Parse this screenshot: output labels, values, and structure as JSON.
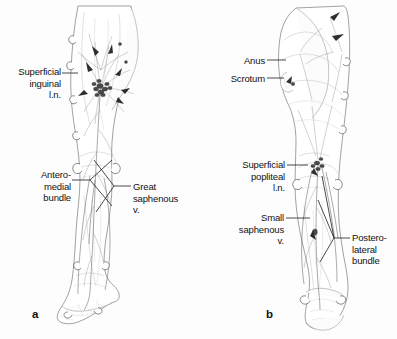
{
  "figure": {
    "kind": "anatomical-illustration",
    "background_color": "#fdfdfd",
    "ink_color": "#1c1c1c"
  },
  "panels": [
    {
      "id": "a",
      "letter": "a",
      "view": "anterior",
      "labels": [
        {
          "id": "superficial-inguinal-ln",
          "text": "Superficial\ninguinal\nl.n.",
          "align": "right",
          "x": 4,
          "y": 66,
          "width": 57,
          "leader": {
            "x1": 62,
            "y1": 73,
            "x2": 78,
            "y2": 73
          }
        },
        {
          "id": "antero-medial-bundle",
          "text": "Antero-\nmedial\nbundle",
          "align": "right",
          "x": 14,
          "y": 169,
          "width": 57,
          "leader": {
            "x1": 72,
            "y1": 180,
            "x2": 90,
            "y2": 180
          }
        },
        {
          "id": "great-saphenous-vein",
          "text": "Great\nsaphenous\nv.",
          "align": "left",
          "x": 133,
          "y": 181,
          "width": 62,
          "leader": {
            "x1": 114,
            "y1": 186,
            "x2": 131,
            "y2": 186
          }
        }
      ]
    },
    {
      "id": "b",
      "letter": "b",
      "view": "posterior",
      "labels": [
        {
          "id": "anus",
          "text": "Anus",
          "align": "right",
          "x": 213,
          "y": 55,
          "width": 52,
          "leader": {
            "x1": 267,
            "y1": 60,
            "x2": 286,
            "y2": 60
          }
        },
        {
          "id": "scrotum",
          "text": "Scrotum",
          "align": "right",
          "x": 207,
          "y": 73,
          "width": 58,
          "leader": {
            "x1": 267,
            "y1": 78,
            "x2": 284,
            "y2": 78
          }
        },
        {
          "id": "superficial-popliteal-ln",
          "text": "Superficial\npopliteal\nl.n.",
          "align": "right",
          "x": 228,
          "y": 159,
          "width": 57,
          "leader": {
            "x1": 287,
            "y1": 165,
            "x2": 308,
            "y2": 165
          }
        },
        {
          "id": "small-saphenous-vein",
          "text": "Small\nsaphenous\nv.",
          "align": "right",
          "x": 222,
          "y": 212,
          "width": 62,
          "leader": {
            "x1": 286,
            "y1": 218,
            "x2": 310,
            "y2": 218
          }
        },
        {
          "id": "postero-lateral-bundle",
          "text": "Postero-\nlateral\nbundle",
          "align": "left",
          "x": 352,
          "y": 232,
          "width": 48,
          "leader": {
            "x1": 334,
            "y1": 238,
            "x2": 350,
            "y2": 238
          }
        }
      ]
    }
  ]
}
